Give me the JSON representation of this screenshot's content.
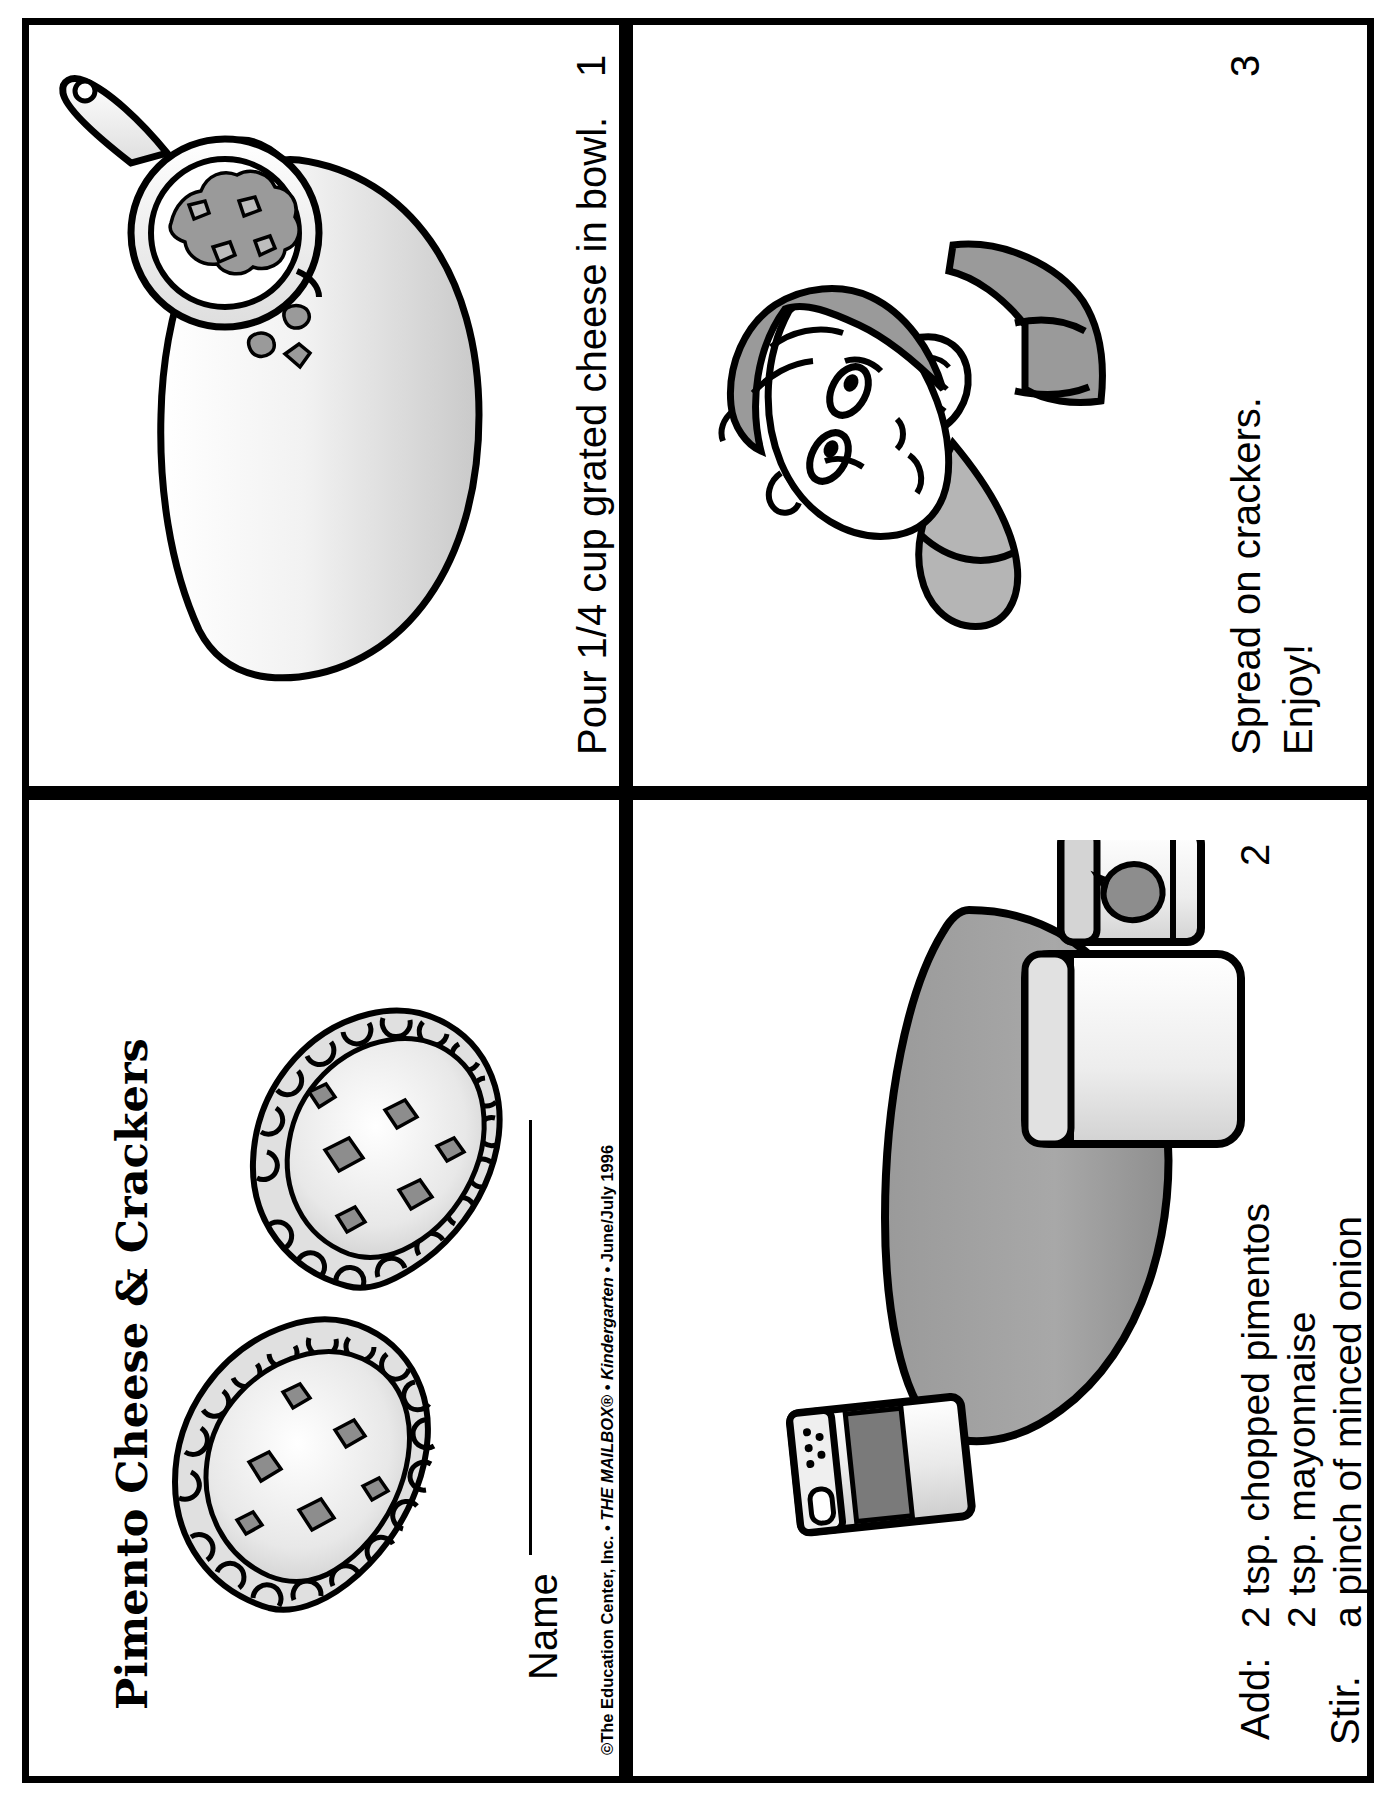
{
  "document": {
    "title": "Pimento Cheese & Crackers",
    "name_label": "Name",
    "copyright_pre": "©The Education Center, Inc. • ",
    "copyright_italic_1": "THE MAILBOX",
    "copyright_reg": "®",
    "copyright_mid": " • ",
    "copyright_italic_2": "Kindergarten",
    "copyright_post": " • June/July 1996"
  },
  "panels": [
    {
      "number": "1",
      "text": "Pour 1/4 cup grated cheese in bowl.",
      "art": "measuring-cup-pouring-cheese-into-bowl"
    },
    {
      "number": "2",
      "lead": "Add:",
      "ingredients": [
        "2 tsp. chopped pimentos",
        "2 tsp. mayonnaise",
        "a pinch of minced onion",
        "a pinch of pepper"
      ],
      "footer": "Stir.",
      "art": "bowl-jars-and-pepper-shaker"
    },
    {
      "number": "3",
      "lines": [
        "Spread on crackers.",
        "Enjoy!"
      ],
      "art": "child-eating-cracker"
    }
  ],
  "colors": {
    "ink": "#000000",
    "paper": "#ffffff",
    "shade_light": "#e3e3e3",
    "shade_mid": "#c9c9c9",
    "shade_dark": "#8d8d8d",
    "shade_darker": "#6f6f6f"
  }
}
